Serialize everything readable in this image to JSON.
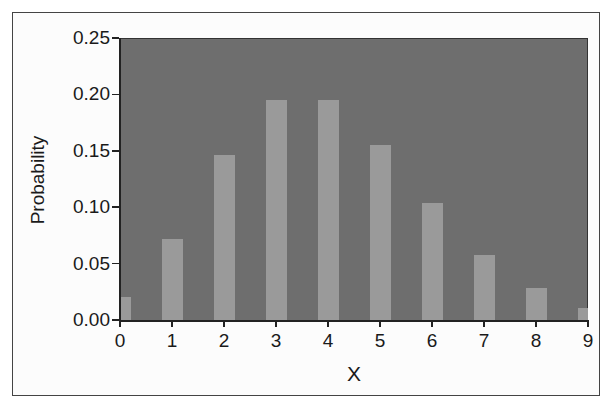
{
  "chart_data": {
    "type": "bar",
    "title": "",
    "xlabel": "X",
    "ylabel": "Probability",
    "categories": [
      "0",
      "1",
      "2",
      "3",
      "4",
      "5",
      "6",
      "7",
      "8",
      "9"
    ],
    "values": [
      0.02,
      0.072,
      0.146,
      0.195,
      0.195,
      0.155,
      0.104,
      0.058,
      0.028,
      0.011
    ],
    "ylim": [
      0,
      0.25
    ],
    "xlim": [
      0,
      9
    ],
    "yticks": [
      "0.00",
      "0.05",
      "0.10",
      "0.15",
      "0.20",
      "0.25"
    ],
    "xticks": [
      "0",
      "1",
      "2",
      "3",
      "4",
      "5",
      "6",
      "7",
      "8",
      "9"
    ],
    "grid": false,
    "legend": null,
    "colors": {
      "plot_background": "#6e6e6e",
      "bar": "#9a9a9a",
      "axis": "#222222"
    }
  }
}
